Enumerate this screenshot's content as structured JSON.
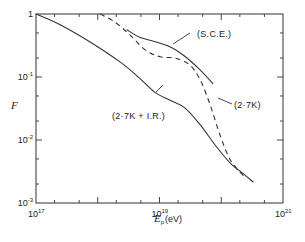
{
  "chart_data": {
    "type": "line",
    "title": "",
    "xlabel": "E_p (eV)",
    "xlabel_main": "E",
    "xlabel_sub": "p",
    "xlabel_unit": "(eV)",
    "ylabel": "F",
    "xscale": "log",
    "yscale": "log",
    "xlim": [
      1e+17,
      1e+21
    ],
    "ylim": [
      0.001,
      1
    ],
    "grid": false,
    "legend": "inline-annotations",
    "x_ticks": [
      {
        "exp": 17,
        "base": "10",
        "sup": "17"
      },
      {
        "exp": 19,
        "base": "10",
        "sup": "19"
      },
      {
        "exp": 21,
        "base": "10",
        "sup": "21"
      }
    ],
    "y_ticks": [
      {
        "exp": 0,
        "base": "1",
        "sup": ""
      },
      {
        "exp": -1,
        "base": "10",
        "sup": "-1"
      },
      {
        "exp": -2,
        "base": "10",
        "sup": "-2"
      },
      {
        "exp": -3,
        "base": "10",
        "sup": "-3"
      }
    ],
    "series": [
      {
        "name": "(2·7K + I.R.)",
        "style": "solid",
        "log10_x": [
          17.0,
          17.39,
          17.87,
          18.36,
          18.68,
          18.92,
          19.17,
          19.41,
          19.66,
          19.9,
          20.15,
          20.39,
          20.52
        ],
        "log10_y": [
          0.0,
          -0.17,
          -0.44,
          -0.76,
          -1.02,
          -1.24,
          -1.37,
          -1.49,
          -1.76,
          -2.08,
          -2.37,
          -2.56,
          -2.67
        ]
      },
      {
        "name": "(2·7K)",
        "style": "dashed",
        "log10_x": [
          18.04,
          18.28,
          18.52,
          18.77,
          19.01,
          19.25,
          19.49,
          19.66,
          19.82,
          19.98,
          20.15,
          20.39
        ],
        "log10_y": [
          0.0,
          -0.13,
          -0.33,
          -0.57,
          -0.68,
          -0.7,
          -0.81,
          -1.05,
          -1.44,
          -1.92,
          -2.32,
          -2.6
        ]
      },
      {
        "name": "(S.C.E.)",
        "style": "solid",
        "log10_x": [
          18.47,
          18.68,
          18.93,
          19.17,
          19.41,
          19.66,
          19.87
        ],
        "log10_y": [
          -0.25,
          -0.37,
          -0.44,
          -0.52,
          -0.67,
          -0.89,
          -1.11
        ]
      }
    ],
    "annotations": [
      {
        "text": "(S.C.E.)",
        "series": "(S.C.E.)"
      },
      {
        "text": "(2·7K)",
        "series": "(2·7K)"
      },
      {
        "text": "(2·7K + I.R.)",
        "series": "(2·7K + I.R.)"
      }
    ]
  }
}
